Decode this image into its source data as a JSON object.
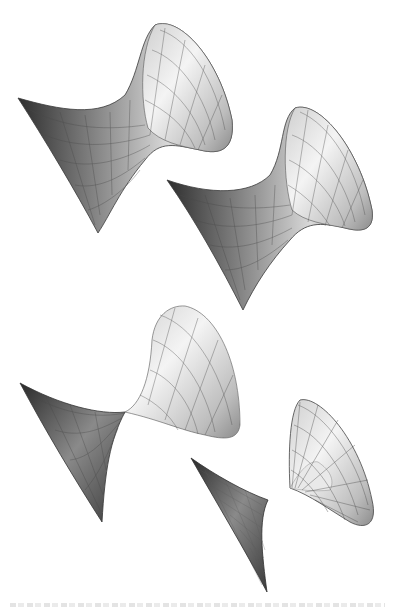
{
  "figure": {
    "type": "3d-surface-illustration",
    "background": "#ffffff",
    "surface_fill_light": "#f2f2f2",
    "surface_fill_dark": "#3a3a3a",
    "mesh_line_color": "#4a4a4a",
    "surfaces": [
      {
        "id": "surface-1",
        "position": "top-left",
        "shape": "hyperboloid-funnel",
        "opening": "upper-right"
      },
      {
        "id": "surface-2",
        "position": "middle-right",
        "shape": "hyperboloid-funnel",
        "opening": "upper-right"
      },
      {
        "id": "surface-3",
        "position": "lower-left",
        "shape": "pinched-funnel",
        "opening": "upper-right"
      },
      {
        "id": "surface-4",
        "position": "bottom-center",
        "shape": "narrow-cusp",
        "opening": "right"
      },
      {
        "id": "surface-5",
        "position": "bottom-right",
        "shape": "flared-cone",
        "opening": "lower-right"
      }
    ]
  },
  "caption": {
    "visible": true,
    "legible": false
  }
}
